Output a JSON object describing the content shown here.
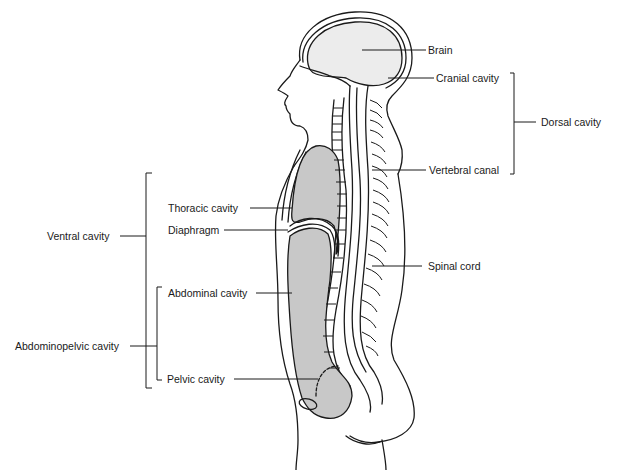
{
  "diagram": {
    "type": "anatomical sagittal section",
    "labels": {
      "brain": "Brain",
      "cranial_cavity": "Cranial cavity",
      "dorsal_cavity": "Dorsal cavity",
      "vertebral_canal": "Vertebral canal",
      "spinal_cord": "Spinal cord",
      "ventral_cavity": "Ventral cavity",
      "thoracic_cavity": "Thoracic cavity",
      "diaphragm": "Diaphragm",
      "abdominal_cavity": "Abdominal cavity",
      "abdominopelvic_cavity": "Abdominopelvic cavity",
      "pelvic_cavity": "Pelvic cavity"
    },
    "groups": {
      "dorsal": [
        "Cranial cavity",
        "Vertebral canal"
      ],
      "ventral": [
        "Thoracic cavity",
        "Abdominopelvic cavity"
      ],
      "abdominopelvic": [
        "Abdominal cavity",
        "Pelvic cavity"
      ]
    },
    "colors": {
      "line": "#1a1a1a",
      "cavity_fill": "#c8c8c8",
      "brain_fill": "#ececec",
      "background": "#ffffff"
    }
  }
}
